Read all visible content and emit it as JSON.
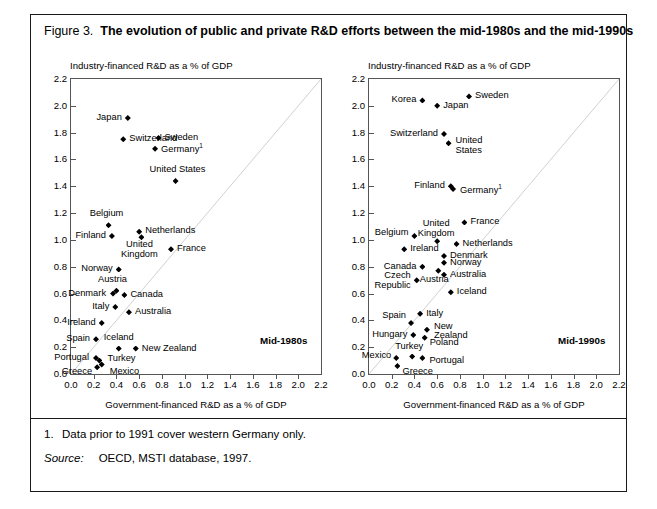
{
  "figure": {
    "number": "Figure 3.",
    "title": "The evolution of public and private R&D efforts between the mid-1980s and the mid-1990s",
    "footnote_marker": "1.",
    "footnote_text": "Data prior to 1991 cover western Germany only.",
    "source_label": "Source:",
    "source_text": "OECD, MSTI database, 1997."
  },
  "chart_data": [
    {
      "type": "scatter",
      "panel_id": "mid-1980s",
      "title": "",
      "era_label": "Mid-1980s",
      "xlabel": "Government-financed R&D as a % of GDP",
      "ylabel": "Industry-financed R&D as a % of GDP",
      "xlim": [
        0.0,
        2.2
      ],
      "ylim": [
        0.0,
        2.2
      ],
      "xticks": [
        "0.0",
        "0.2",
        "0.4",
        "0.6",
        "0.8",
        "1.0",
        "1.2",
        "1.4",
        "1.6",
        "1.8",
        "2.0",
        "2.2"
      ],
      "yticks": [
        "0.0",
        "0.2",
        "0.4",
        "0.6",
        "0.8",
        "1.0",
        "1.2",
        "1.4",
        "1.6",
        "1.8",
        "2.0",
        "2.2"
      ],
      "grid": false,
      "legend": "none",
      "reference_line": "45-degree diagonal y = x",
      "points": [
        {
          "name": "Japan",
          "x": 0.5,
          "y": 1.91,
          "label_pos": "r"
        },
        {
          "name": "Switzerland",
          "x": 0.46,
          "y": 1.75,
          "label_pos": "l"
        },
        {
          "name": "Sweden",
          "x": 0.77,
          "y": 1.76,
          "label_pos": "l"
        },
        {
          "name": "Germany",
          "x": 0.74,
          "y": 1.68,
          "label_pos": "l",
          "footnote": "1"
        },
        {
          "name": "United States",
          "x": 0.92,
          "y": 1.44,
          "label_pos": "c"
        },
        {
          "name": "Belgium",
          "x": 0.33,
          "y": 1.11,
          "label_pos": "c"
        },
        {
          "name": "Netherlands",
          "x": 0.6,
          "y": 1.06,
          "label_pos": "l"
        },
        {
          "name": "Finland",
          "x": 0.36,
          "y": 1.03,
          "label_pos": "r"
        },
        {
          "name": "United Kingdom",
          "x": 0.62,
          "y": 1.02,
          "label_pos": "c"
        },
        {
          "name": "France",
          "x": 0.88,
          "y": 0.93,
          "label_pos": "l"
        },
        {
          "name": "Norway",
          "x": 0.42,
          "y": 0.78,
          "label_pos": "r"
        },
        {
          "name": "Austria",
          "x": 0.4,
          "y": 0.62,
          "label_pos": "c"
        },
        {
          "name": "Denmark",
          "x": 0.37,
          "y": 0.6,
          "label_pos": "r"
        },
        {
          "name": "Canada",
          "x": 0.47,
          "y": 0.59,
          "label_pos": "l"
        },
        {
          "name": "Italy",
          "x": 0.39,
          "y": 0.5,
          "label_pos": "r"
        },
        {
          "name": "Australia",
          "x": 0.51,
          "y": 0.46,
          "label_pos": "l"
        },
        {
          "name": "Ireland",
          "x": 0.27,
          "y": 0.38,
          "label_pos": "r"
        },
        {
          "name": "Spain",
          "x": 0.22,
          "y": 0.26,
          "label_pos": "r"
        },
        {
          "name": "Iceland",
          "x": 0.42,
          "y": 0.19,
          "label_pos": "c"
        },
        {
          "name": "New Zealand",
          "x": 0.57,
          "y": 0.19,
          "label_pos": "l"
        },
        {
          "name": "Portugal",
          "x": 0.22,
          "y": 0.12,
          "label_pos": "r"
        },
        {
          "name": "Turkey",
          "x": 0.25,
          "y": 0.1,
          "label_pos": "l"
        },
        {
          "name": "Mexico",
          "x": 0.27,
          "y": 0.07,
          "label_pos": "l"
        },
        {
          "name": "Greece",
          "x": 0.23,
          "y": 0.05,
          "label_pos": "r"
        }
      ]
    },
    {
      "type": "scatter",
      "panel_id": "mid-1990s",
      "title": "",
      "era_label": "Mid-1990s",
      "xlabel": "Government-financed R&D as a % of GDP",
      "ylabel": "Industry-financed R&D as a % of GDP",
      "xlim": [
        0.0,
        2.2
      ],
      "ylim": [
        0.0,
        2.2
      ],
      "xticks": [
        "0.0",
        "0.2",
        "0.4",
        "0.6",
        "0.8",
        "1.0",
        "1.2",
        "1.4",
        "1.6",
        "1.8",
        "2.0",
        "2.2"
      ],
      "yticks": [
        "0.0",
        "0.2",
        "0.4",
        "0.6",
        "0.8",
        "1.0",
        "1.2",
        "1.4",
        "1.6",
        "1.8",
        "2.0",
        "2.2"
      ],
      "grid": false,
      "legend": "none",
      "reference_line": "45-degree diagonal y = x",
      "points": [
        {
          "name": "Sweden",
          "x": 0.88,
          "y": 2.07,
          "label_pos": "l"
        },
        {
          "name": "Korea",
          "x": 0.47,
          "y": 2.04,
          "label_pos": "r"
        },
        {
          "name": "Japan",
          "x": 0.6,
          "y": 2.0,
          "label_pos": "l"
        },
        {
          "name": "Switzerland",
          "x": 0.66,
          "y": 1.79,
          "label_pos": "r"
        },
        {
          "name": "United States",
          "x": 0.7,
          "y": 1.72,
          "label_pos": "l"
        },
        {
          "name": "Finland",
          "x": 0.72,
          "y": 1.4,
          "label_pos": "r"
        },
        {
          "name": "Germany",
          "x": 0.74,
          "y": 1.38,
          "label_pos": "l",
          "footnote": "1"
        },
        {
          "name": "France",
          "x": 0.84,
          "y": 1.13,
          "label_pos": "l"
        },
        {
          "name": "Belgium",
          "x": 0.4,
          "y": 1.03,
          "label_pos": "r"
        },
        {
          "name": "United Kingdom",
          "x": 0.6,
          "y": 0.99,
          "label_pos": "c"
        },
        {
          "name": "Netherlands",
          "x": 0.77,
          "y": 0.97,
          "label_pos": "l"
        },
        {
          "name": "Ireland",
          "x": 0.31,
          "y": 0.93,
          "label_pos": "l"
        },
        {
          "name": "Denmark",
          "x": 0.66,
          "y": 0.88,
          "label_pos": "l"
        },
        {
          "name": "Norway",
          "x": 0.66,
          "y": 0.83,
          "label_pos": "l"
        },
        {
          "name": "Canada",
          "x": 0.47,
          "y": 0.8,
          "label_pos": "r"
        },
        {
          "name": "Austria",
          "x": 0.61,
          "y": 0.77,
          "label_pos": "c"
        },
        {
          "name": "Australia",
          "x": 0.66,
          "y": 0.74,
          "label_pos": "l"
        },
        {
          "name": "Czech Republic",
          "x": 0.42,
          "y": 0.7,
          "label_pos": "r"
        },
        {
          "name": "Iceland",
          "x": 0.72,
          "y": 0.61,
          "label_pos": "l"
        },
        {
          "name": "Italy",
          "x": 0.45,
          "y": 0.45,
          "label_pos": "l"
        },
        {
          "name": "Spain",
          "x": 0.37,
          "y": 0.38,
          "label_pos": "r"
        },
        {
          "name": "New Zealand",
          "x": 0.51,
          "y": 0.33,
          "label_pos": "l"
        },
        {
          "name": "Hungary",
          "x": 0.39,
          "y": 0.29,
          "label_pos": "r"
        },
        {
          "name": "Poland",
          "x": 0.49,
          "y": 0.27,
          "label_pos": "l"
        },
        {
          "name": "Turkey",
          "x": 0.38,
          "y": 0.13,
          "label_pos": "c"
        },
        {
          "name": "Portugal",
          "x": 0.47,
          "y": 0.12,
          "label_pos": "l"
        },
        {
          "name": "Mexico",
          "x": 0.24,
          "y": 0.12,
          "label_pos": "r"
        },
        {
          "name": "Greece",
          "x": 0.25,
          "y": 0.06,
          "label_pos": "l"
        }
      ]
    }
  ]
}
